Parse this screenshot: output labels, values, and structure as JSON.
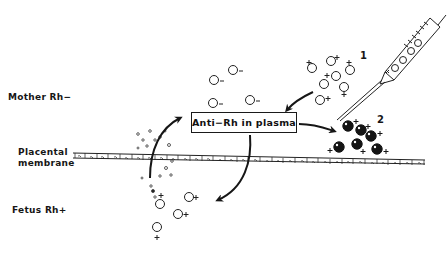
{
  "labels": {
    "mother": "Mother Rh−",
    "placental_line1": "Placental",
    "placental_line2": "membrane",
    "fetus": "Fetus Rh+"
  },
  "box": {
    "text": "Anti−Rh in plasma"
  },
  "markers": {
    "step1": "1",
    "step2": "2"
  },
  "cells": {
    "mother_rh_negative_sign": "−",
    "rh_positive_sign": "+"
  },
  "colors": {
    "ink": "#161616",
    "background": "#ffffff"
  }
}
